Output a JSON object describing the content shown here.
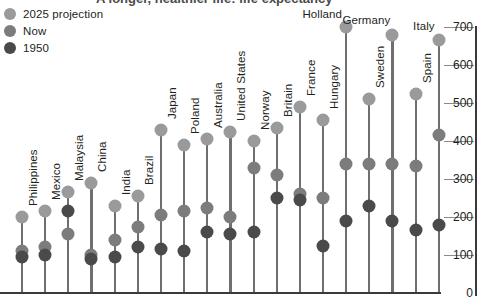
{
  "title_clipped": "A longer, healthier life: life expectancy",
  "legend": {
    "position": "top-left",
    "items": [
      {
        "label": "2025 projection",
        "color": "#9a9a9a",
        "key": "y2025"
      },
      {
        "label": "Now",
        "color": "#7c7c7c",
        "key": "now"
      },
      {
        "label": "1950",
        "color": "#4a4a4a",
        "key": "y1950"
      }
    ]
  },
  "yaxis": {
    "min": 0,
    "max": 700,
    "ticks": [
      0,
      100,
      200,
      300,
      400,
      500,
      600,
      700
    ],
    "labels": [
      "0",
      "100",
      "200",
      "300",
      "400",
      "500",
      "600",
      "700"
    ]
  },
  "chart_data": {
    "type": "scatter",
    "title": "A longer, healthier life: life expectancy",
    "xlabel": "",
    "ylabel": "",
    "ylim": [
      0,
      700
    ],
    "grid": true,
    "legend_position": "top-left",
    "categories": [
      "Philippines",
      "Mexico",
      "Malaysia",
      "China",
      "India",
      "Brazil",
      "Japan",
      "Poland",
      "Australia",
      "United States",
      "Norway",
      "Britain",
      "France",
      "Hungary",
      "Holland",
      "Sweden",
      "Germany",
      "Spain",
      "Italy"
    ],
    "series": [
      {
        "name": "2025 projection",
        "color": "#9a9a9a",
        "values": [
          200,
          215,
          265,
          290,
          230,
          255,
          430,
          390,
          405,
          425,
          400,
          435,
          490,
          455,
          700,
          510,
          680,
          525,
          665
        ]
      },
      {
        "name": "Now",
        "color": "#7c7c7c",
        "values": [
          110,
          120,
          155,
          100,
          140,
          175,
          205,
          215,
          225,
          200,
          330,
          310,
          260,
          250,
          340,
          340,
          340,
          335,
          415
        ]
      },
      {
        "name": "1950",
        "color": "#4a4a4a",
        "values": [
          95,
          100,
          215,
          90,
          95,
          120,
          115,
          110,
          160,
          155,
          160,
          250,
          245,
          125,
          190,
          230,
          190,
          165,
          180
        ]
      }
    ]
  }
}
